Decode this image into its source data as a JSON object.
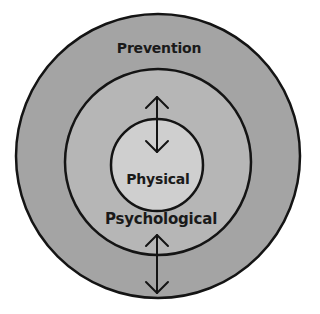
{
  "diagram": {
    "type": "concentric-circles",
    "colors": {
      "background": "#ffffff",
      "outer_ring": "#a4a4a4",
      "middle_ring": "#b6b6b6",
      "inner_circle": "#cfcfcf",
      "stroke": "#141414"
    },
    "layers": [
      {
        "id": "outer",
        "label": "Prevention"
      },
      {
        "id": "middle",
        "label": "Psychological"
      },
      {
        "id": "inner",
        "label": "Physical"
      }
    ],
    "arrows": [
      {
        "name": "top-bidirectional-arrow",
        "between": [
          "Psychological",
          "Physical"
        ]
      },
      {
        "name": "bottom-bidirectional-arrow",
        "between": [
          "Psychological",
          "Prevention"
        ]
      }
    ]
  }
}
